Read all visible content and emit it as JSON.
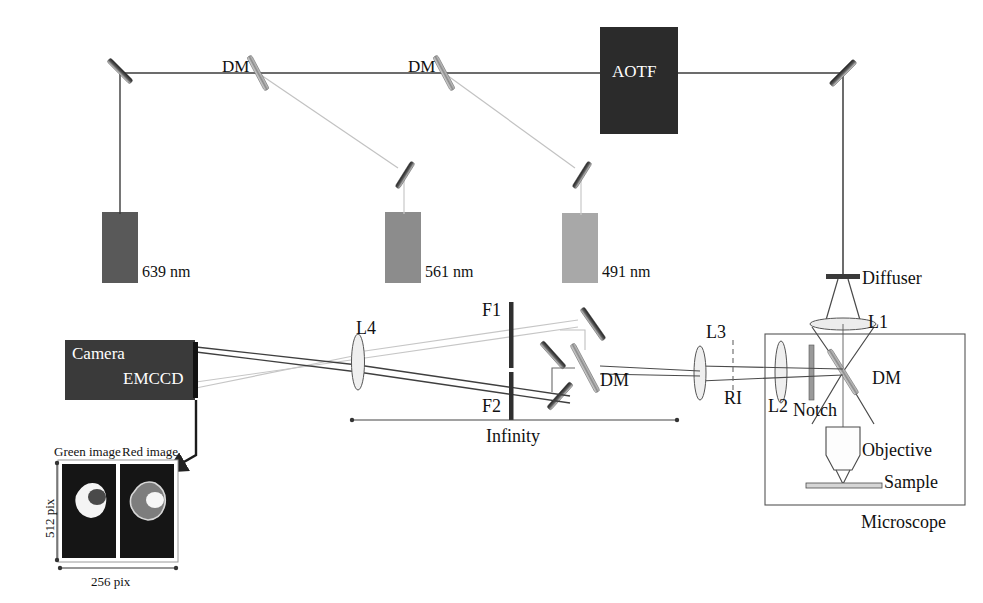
{
  "figure": {
    "type": "optical-setup-diagram"
  },
  "illumination": {
    "aotf": {
      "label": "AOTF",
      "x": 600,
      "y": 27,
      "w": 78,
      "h": 107,
      "color": "#2b2b2b"
    },
    "lasers": [
      {
        "label": "639 nm",
        "wavelength": 639,
        "color": "#595959",
        "x": 102,
        "y": 212,
        "w": 36,
        "h": 71,
        "label_x": 142,
        "label_y": 263
      },
      {
        "label": "561 nm",
        "wavelength": 561,
        "color": "#8c8c8c",
        "x": 385,
        "y": 212,
        "w": 36,
        "h": 71,
        "label_x": 425,
        "label_y": 263
      },
      {
        "label": "491 nm",
        "wavelength": 491,
        "color": "#a8a8a8",
        "x": 562,
        "y": 213,
        "w": 36,
        "h": 70,
        "label_x": 602,
        "label_y": 263
      }
    ],
    "dichroics": [
      {
        "label": "DM",
        "label_x": 222,
        "label_y": 57,
        "mirror_x": 258,
        "mirror_y": 73
      },
      {
        "label": "DM",
        "label_x": 408,
        "label_y": 57,
        "mirror_x": 444,
        "mirror_y": 73
      }
    ],
    "steering_mirrors": [
      {
        "name": "mirror-top-left",
        "x": 120,
        "y": 71,
        "angle": 45
      },
      {
        "name": "mirror-561",
        "x": 405,
        "y": 175,
        "angle": -58
      },
      {
        "name": "mirror-491",
        "x": 582,
        "y": 175,
        "angle": -58
      },
      {
        "name": "mirror-top-right",
        "x": 843,
        "y": 73,
        "angle": -45
      }
    ]
  },
  "microscope": {
    "label": "Microscope",
    "label_x": 865,
    "label_y": 521,
    "box": {
      "x": 765,
      "y": 334,
      "w": 200,
      "h": 171
    },
    "components": [
      {
        "name": "diffuser",
        "label": "Diffuser",
        "label_x": 860,
        "label_y": 279
      },
      {
        "name": "lens-l1",
        "label": "L1",
        "label_x": 862,
        "label_y": 322
      },
      {
        "name": "lens-l2",
        "label": "L2",
        "label_x": 772,
        "label_y": 402
      },
      {
        "name": "notch-filter",
        "label": "Notch",
        "label_x": 797,
        "label_y": 405
      },
      {
        "name": "dichroic-mirror",
        "label": "DM",
        "label_x": 872,
        "label_y": 377
      },
      {
        "name": "objective",
        "label": "Objective",
        "label_x": 865,
        "label_y": 449
      },
      {
        "name": "sample",
        "label": "Sample",
        "label_x": 884,
        "label_y": 478
      }
    ]
  },
  "detection": {
    "camera": {
      "name": "emccd-camera",
      "label_top": "Camera",
      "label_bottom": "EMCCD",
      "x": 65,
      "y": 340,
      "w": 130,
      "h": 60,
      "color": "#3a3a3a"
    },
    "components": [
      {
        "name": "lens-l4",
        "label": "L4",
        "label_x": 363,
        "label_y": 318
      },
      {
        "name": "filter-f1",
        "label": "F1",
        "label_x": 449,
        "label_y": 310
      },
      {
        "name": "filter-f2",
        "label": "F2",
        "label_x": 449,
        "label_y": 398
      },
      {
        "name": "dichroic-splitter",
        "label": "DM",
        "label_x": 603,
        "label_y": 375
      },
      {
        "name": "lens-l3",
        "label": "L3",
        "label_x": 712,
        "label_y": 325
      },
      {
        "name": "intermediate-image-plane",
        "label": "RI",
        "label_x": 733,
        "label_y": 398
      }
    ],
    "infinity_span": {
      "label": "Infinity",
      "label_x": 515,
      "label_y": 430,
      "x1": 352,
      "x2": 677,
      "y": 420
    }
  },
  "inset": {
    "panels": [
      {
        "name": "green-image-panel",
        "label": "Green image",
        "label_x": 98,
        "label_y": 452,
        "x": 62,
        "y": 464,
        "w": 54,
        "h": 94
      },
      {
        "name": "red-image-panel",
        "label": "Red image",
        "label_x": 152,
        "label_y": 452,
        "x": 120,
        "y": 464,
        "w": 54,
        "h": 94
      }
    ],
    "frame": {
      "x": 58,
      "y": 460,
      "w": 120,
      "h": 102
    },
    "dimensions": {
      "vertical": {
        "label": "512 pix",
        "x": 46,
        "y": 512
      },
      "horizontal": {
        "label": "256 pix",
        "x": 118,
        "y": 580
      }
    }
  },
  "colors": {
    "line": "#3b3b3b",
    "faint_line": "#b9b9b9",
    "dark_box": "#2b2b2b",
    "camera_box": "#3a3a3a",
    "cell_green": "#f2f2f2",
    "cell_red": "#7d7d7d",
    "panel_bg": "#151515"
  }
}
